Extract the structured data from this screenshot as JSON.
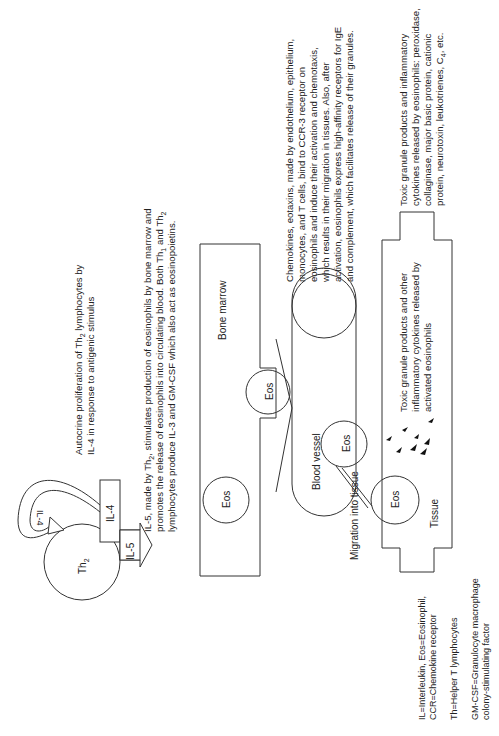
{
  "diagram": {
    "orientation": "rotated-90-ccw",
    "labels": {
      "th2": "Th",
      "th2_sub": "2",
      "il4_box": "IL-4",
      "il4_arrow": "IL-4",
      "il5_arrow": "IL-5",
      "bone_marrow": "Bone marrow",
      "blood_vessel": "Blood vessel",
      "tissue": "Tissue",
      "migration": "Migration into tissue",
      "eos_marrow": "Eos",
      "eos_crossing": "Eos",
      "eos_vessel": "Eos",
      "eos_tissue": "Eos"
    },
    "annotations": {
      "autocrine": [
        [
          "Autocrine proliferation of Th",
          "2",
          " lymphocytes by"
        ],
        [
          "IL-4 in response to antigenic stimulus"
        ]
      ],
      "il5": [
        [
          "IL-5, made by Th",
          "2",
          ", stimulates production of eosinophils by bone marrow and"
        ],
        [
          "promotes the release of eosinophils into  circulating blood. Both Th",
          "1",
          " and Th",
          "2"
        ],
        [
          "lymphocytes produce IL-3 and GM-CSF which also act as eosinopoietins."
        ]
      ],
      "chemokines": [
        "Chemokines, eotaxins, made by endothelium, epithelium,",
        "monocytes, and T cells,  bind to CCR-3 receptor on",
        "eosinophils and induce their activation and chemotaxis,",
        "which results in their migration in tissues. Also, after",
        "activation, eosinophils express high-affinity receptors for IgE",
        "and complement, which facilitates release of their granules."
      ],
      "toxic_in_tissue": [
        "Toxic granule products and other",
        "inflammatory cytokines released by",
        "activated eosinophils"
      ],
      "toxic_outside": [
        [
          "Toxic granule products and inflammatory"
        ],
        [
          "cytokines released by eosinophils: peroxidase,"
        ],
        [
          "collaginase, major basic protein, cationic"
        ],
        [
          "protein, neurotoxin, leukotrienes, C",
          "4",
          ", etc."
        ]
      ]
    },
    "legend": [
      [
        "IL=Interleukin, Eos=Eosinophil,",
        "CCR=Chemokine receptor"
      ],
      [
        "Th=Helper T lymphocytes"
      ],
      [
        "GM-CSF=Granulocyte macrophage",
        "colony-stimulating factor"
      ]
    ],
    "colors": {
      "stroke": "#333333",
      "text": "#222222",
      "background": "#ffffff"
    }
  }
}
